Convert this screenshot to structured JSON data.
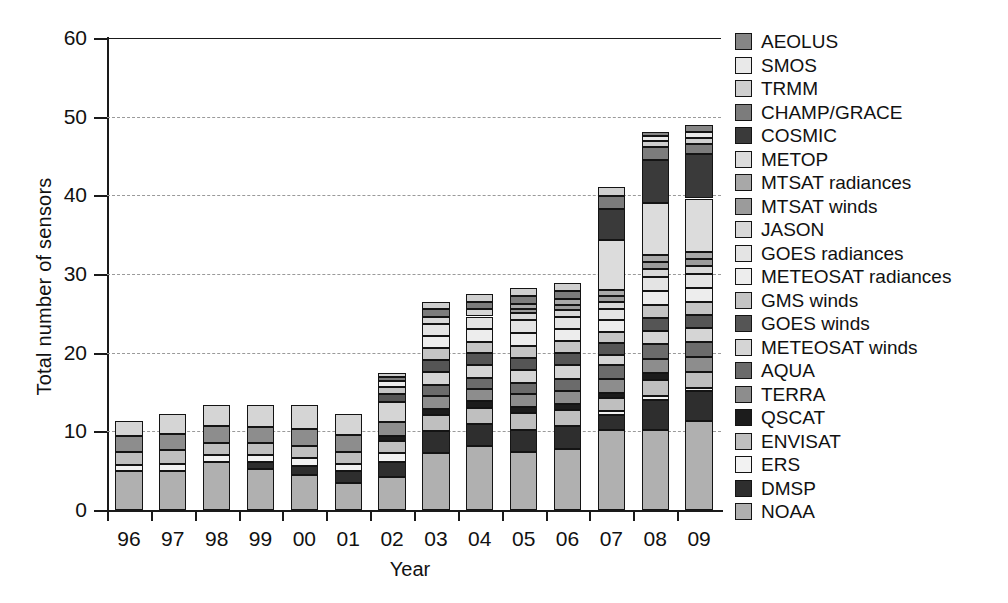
{
  "chart_data": {
    "type": "bar",
    "stacked": true,
    "title": "",
    "xlabel": "Year",
    "ylabel": "Total number of sensors",
    "ylim": [
      0,
      60
    ],
    "yticks": [
      0,
      10,
      20,
      30,
      40,
      50,
      60
    ],
    "grid": "horizontal-dashed",
    "legend_position": "right",
    "categories": [
      "96",
      "97",
      "98",
      "99",
      "00",
      "01",
      "02",
      "03",
      "04",
      "05",
      "06",
      "07",
      "08",
      "09"
    ],
    "totals": [
      11.3,
      12.2,
      13.3,
      13.3,
      13.3,
      12.2,
      15.4,
      28.0,
      28.0,
      29.0,
      29.0,
      47.0,
      52.0,
      53.0
    ],
    "series": [
      {
        "name": "NOAA",
        "color": "#b0b0b0",
        "values": [
          5.0,
          5.0,
          6.1,
          5.2,
          4.4,
          3.4,
          4.2,
          7.3,
          8.2,
          7.4,
          7.8,
          10.2,
          10.2,
          11.3
        ]
      },
      {
        "name": "DMSP",
        "color": "#2e2e2e",
        "values": [
          0.0,
          0.0,
          0.0,
          0.9,
          1.2,
          1.5,
          1.9,
          2.7,
          2.7,
          2.8,
          2.9,
          1.9,
          3.8,
          3.8
        ]
      },
      {
        "name": "ERS",
        "color": "#f2f2f2",
        "values": [
          0.7,
          0.8,
          0.9,
          0.9,
          1.0,
          1.0,
          1.1,
          0.0,
          0.0,
          0.0,
          0.0,
          0.5,
          0.5,
          0.4
        ]
      },
      {
        "name": "ENVISAT",
        "color": "#bfbfbf",
        "values": [
          1.7,
          1.8,
          1.5,
          1.5,
          1.5,
          1.5,
          1.6,
          2.1,
          2.1,
          2.1,
          2.0,
          1.6,
          2.0,
          2.1
        ]
      },
      {
        "name": "QSCAT",
        "color": "#1c1c1c",
        "values": [
          0.0,
          0.0,
          0.0,
          0.0,
          0.0,
          0.0,
          0.6,
          0.8,
          0.8,
          0.8,
          0.8,
          0.7,
          0.9,
          0.0
        ]
      },
      {
        "name": "TERRA",
        "color": "#8d8d8d",
        "values": [
          2.0,
          2.1,
          2.2,
          2.1,
          2.2,
          2.1,
          1.8,
          1.6,
          1.6,
          1.6,
          1.6,
          1.7,
          1.8,
          1.8
        ]
      },
      {
        "name": "AQUA",
        "color": "#6b6b6b",
        "values": [
          0.0,
          0.0,
          0.0,
          0.0,
          0.0,
          0.0,
          0.0,
          1.4,
          1.4,
          1.5,
          1.6,
          1.8,
          1.9,
          2.0
        ]
      },
      {
        "name": "METEOSAT winds",
        "color": "#d5d5d5",
        "values": [
          1.9,
          2.5,
          2.6,
          2.7,
          3.0,
          2.7,
          2.5,
          1.6,
          1.6,
          1.6,
          1.7,
          1.3,
          1.6,
          1.7
        ]
      },
      {
        "name": "GOES winds",
        "color": "#555555",
        "values": [
          0.0,
          0.0,
          0.0,
          0.0,
          0.0,
          0.0,
          1.0,
          1.6,
          1.5,
          1.5,
          1.6,
          1.5,
          1.7,
          1.7
        ]
      },
      {
        "name": "GMS winds",
        "color": "#c4c4c4",
        "values": [
          0.0,
          0.0,
          0.0,
          0.0,
          0.0,
          0.0,
          0.9,
          1.5,
          1.5,
          1.6,
          1.5,
          1.4,
          1.6,
          1.6
        ]
      },
      {
        "name": "METEOSAT radiances",
        "color": "#ededed",
        "values": [
          0.0,
          0.0,
          0.0,
          0.0,
          0.0,
          0.0,
          0.8,
          1.5,
          1.6,
          1.6,
          1.5,
          1.5,
          1.8,
          1.8
        ]
      },
      {
        "name": "GOES radiances",
        "color": "#e4e4e4",
        "values": [
          0.0,
          0.0,
          0.0,
          0.0,
          0.0,
          0.0,
          0.0,
          1.5,
          1.6,
          1.6,
          1.5,
          1.5,
          1.8,
          1.8
        ]
      },
      {
        "name": "JASON",
        "color": "#d8d8d8",
        "values": [
          0.0,
          0.0,
          0.0,
          0.0,
          0.0,
          0.0,
          0.0,
          0.9,
          0.9,
          0.9,
          0.9,
          0.8,
          1.0,
          1.0
        ]
      },
      {
        "name": "MTSAT winds",
        "color": "#9b9b9b",
        "values": [
          0.0,
          0.0,
          0.0,
          0.0,
          0.0,
          0.0,
          0.0,
          0.0,
          0.0,
          0.6,
          0.7,
          0.8,
          0.9,
          0.9
        ]
      },
      {
        "name": "MTSAT radiances",
        "color": "#a8a8a8",
        "values": [
          0.0,
          0.0,
          0.0,
          0.0,
          0.0,
          0.0,
          0.0,
          0.0,
          0.0,
          0.6,
          0.7,
          0.8,
          0.9,
          0.9
        ]
      },
      {
        "name": "METOP",
        "color": "#dcdcdc",
        "values": [
          0.0,
          0.0,
          0.0,
          0.0,
          0.0,
          0.0,
          0.0,
          0.0,
          0.0,
          0.0,
          0.0,
          6.3,
          6.6,
          6.8
        ]
      },
      {
        "name": "COSMIC",
        "color": "#3a3a3a",
        "values": [
          0.0,
          0.0,
          0.0,
          0.0,
          0.0,
          0.0,
          0.0,
          0.0,
          0.0,
          0.0,
          0.0,
          4.0,
          5.5,
          5.6
        ]
      },
      {
        "name": "CHAMP/GRACE",
        "color": "#7c7c7c",
        "values": [
          0.0,
          0.0,
          0.0,
          0.0,
          0.0,
          0.0,
          0.5,
          1.0,
          1.0,
          1.0,
          1.0,
          1.6,
          1.6,
          1.3
        ]
      },
      {
        "name": "TRMM",
        "color": "#cfcfcf",
        "values": [
          0.0,
          0.0,
          0.0,
          0.0,
          0.0,
          0.0,
          0.5,
          1.0,
          1.0,
          1.0,
          1.0,
          1.1,
          0.8,
          0.8
        ]
      },
      {
        "name": "SMOS",
        "color": "#e9e9e9",
        "values": [
          0.0,
          0.0,
          0.0,
          0.0,
          0.0,
          0.0,
          0.0,
          0.0,
          0.0,
          0.0,
          0.0,
          0.0,
          0.6,
          0.8
        ]
      },
      {
        "name": "AEOLUS",
        "color": "#868686",
        "values": [
          0.0,
          0.0,
          0.0,
          0.0,
          0.0,
          0.0,
          0.0,
          0.0,
          0.0,
          0.0,
          0.0,
          0.0,
          0.6,
          0.9
        ]
      }
    ]
  },
  "legend": {
    "items": [
      {
        "label": "AEOLUS",
        "color": "#868686"
      },
      {
        "label": "SMOS",
        "color": "#e9e9e9"
      },
      {
        "label": "TRMM",
        "color": "#cfcfcf"
      },
      {
        "label": "CHAMP/GRACE",
        "color": "#7c7c7c"
      },
      {
        "label": "COSMIC",
        "color": "#3a3a3a"
      },
      {
        "label": "METOP",
        "color": "#dcdcdc"
      },
      {
        "label": "MTSAT radiances",
        "color": "#a8a8a8"
      },
      {
        "label": "MTSAT winds",
        "color": "#9b9b9b"
      },
      {
        "label": "JASON",
        "color": "#d8d8d8"
      },
      {
        "label": "GOES radiances",
        "color": "#e4e4e4"
      },
      {
        "label": "METEOSAT radiances",
        "color": "#ededed"
      },
      {
        "label": "GMS winds",
        "color": "#c4c4c4"
      },
      {
        "label": "GOES winds",
        "color": "#555555"
      },
      {
        "label": "METEOSAT winds",
        "color": "#d5d5d5"
      },
      {
        "label": "AQUA",
        "color": "#6b6b6b"
      },
      {
        "label": "TERRA",
        "color": "#8d8d8d"
      },
      {
        "label": "QSCAT",
        "color": "#1c1c1c"
      },
      {
        "label": "ENVISAT",
        "color": "#bfbfbf"
      },
      {
        "label": "ERS",
        "color": "#f2f2f2"
      },
      {
        "label": "DMSP",
        "color": "#2e2e2e"
      },
      {
        "label": "NOAA",
        "color": "#b0b0b0"
      }
    ]
  }
}
